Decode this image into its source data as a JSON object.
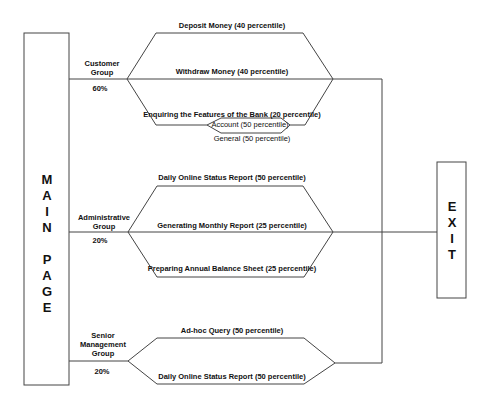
{
  "main_page": {
    "label": "MAIN PAGE",
    "letters": [
      "M",
      "A",
      "I",
      "N",
      "",
      "P",
      "A",
      "G",
      "E"
    ]
  },
  "exit": {
    "label": "EXIT",
    "letters": [
      "E",
      "X",
      "I",
      "T"
    ]
  },
  "groups": [
    {
      "name": "Customer Group",
      "name_lines": [
        "Customer",
        "Group"
      ],
      "share": "60%",
      "actions": [
        "Deposit Money (40 percentile)",
        "Withdraw Money (40 percentile)",
        "Enquiring the Features of the Bank (20 percentile)"
      ],
      "sub_actions": [
        "Account  (50 percentile)",
        "General  (50 percentile)"
      ]
    },
    {
      "name": "Administrative Group",
      "name_lines": [
        "Administrative",
        "Group"
      ],
      "share": "20%",
      "actions": [
        "Daily Online Status Report (50 percentile)",
        "Generating Monthly Report (25 percentile)",
        "Preparing Annual Balance Sheet (25 percentile)"
      ]
    },
    {
      "name": "Senior Management Group",
      "name_lines": [
        "Senior",
        "Management",
        "Group"
      ],
      "share": "20%",
      "actions": [
        "Ad-hoc Query (50 percentile)",
        "Daily Online Status Report (50 percentile)"
      ]
    }
  ]
}
